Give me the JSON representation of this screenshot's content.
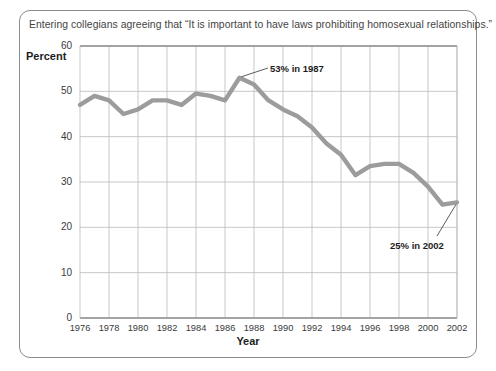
{
  "chart_data": {
    "type": "line",
    "title": "Entering collegians agreeing that “It is important to have laws prohibiting homosexual relationships.”",
    "xlabel": "Year",
    "ylabel": "Percent",
    "xlim": [
      1976,
      2002
    ],
    "ylim": [
      0,
      60
    ],
    "grid": true,
    "legend": "none",
    "line_color": "#9c9c9c",
    "x": [
      1976,
      1977,
      1978,
      1979,
      1980,
      1981,
      1982,
      1983,
      1984,
      1985,
      1986,
      1987,
      1988,
      1989,
      1990,
      1991,
      1992,
      1993,
      1994,
      1995,
      1996,
      1997,
      1998,
      1999,
      2000,
      2001,
      2002
    ],
    "values": [
      47,
      49,
      48,
      45,
      46,
      48,
      48,
      47,
      49.5,
      49,
      48,
      53,
      51.5,
      48,
      46,
      44.5,
      42,
      38.5,
      36,
      31.5,
      33.5,
      34,
      34,
      32,
      29,
      25,
      25.5
    ],
    "xticks": [
      "1976",
      "1978",
      "1980",
      "1982",
      "1984",
      "1986",
      "1988",
      "1990",
      "1992",
      "1994",
      "1996",
      "1998",
      "2000",
      "2002"
    ],
    "xtick_values": [
      1976,
      1978,
      1980,
      1982,
      1984,
      1986,
      1988,
      1990,
      1992,
      1994,
      1996,
      1998,
      2000,
      2002
    ],
    "yticks": [
      "0",
      "10",
      "20",
      "30",
      "40",
      "50",
      "60"
    ],
    "ytick_values": [
      0,
      10,
      20,
      30,
      40,
      50,
      60
    ],
    "annotations": [
      {
        "text": "53% in 1987",
        "point_x": 1987,
        "point_y": 53
      },
      {
        "text": "25% in 2002",
        "point_x": 2002,
        "point_y": 25.5
      }
    ]
  }
}
